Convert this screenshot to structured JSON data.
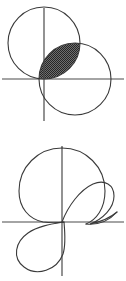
{
  "page": {
    "width": 126,
    "height": 281,
    "background_color": "#ffffff"
  },
  "style": {
    "curve_color": "#3a3a3a",
    "axis_color": "#4a4a4a",
    "shade_fill_color": "#4a4a4a",
    "shade_dot_color": "#2b2b2b",
    "curve_width": 1.1,
    "axis_width": 1.2
  },
  "figures": [
    {
      "id": "figure-top",
      "name": "two-overlapping-circles-with-shaded-lens",
      "caption": "Two equal circles intersecting; the lens-shaped overlap region is shaded",
      "axes": {
        "origin_x": 44,
        "origin_y": 79,
        "x_axis_start": 2,
        "x_axis_end": 124,
        "y_axis_start": 8,
        "y_axis_end": 121
      },
      "shapes": [
        {
          "name": "upper-left-circle",
          "type": "circle",
          "cx": 44,
          "cy": 43,
          "r": 36
        },
        {
          "name": "lower-right-circle",
          "type": "circle",
          "cx": 75,
          "cy": 79,
          "r": 36
        }
      ],
      "shaded_region": {
        "name": "lens-intersection",
        "type": "lens",
        "fill": "crosshatch-dots",
        "vertex_a_x": 44,
        "vertex_a_y": 79,
        "vertex_b_x": 75,
        "vertex_b_y": 43
      }
    },
    {
      "id": "figure-bottom",
      "name": "limacon-with-inner-loop",
      "caption": "A limacon style curve: large outer circular lobe, inner loop at the right, and a lower-left lobe crossing the origin",
      "axes": {
        "origin_x": 62,
        "origin_y": 222,
        "x_axis_start": 2,
        "x_axis_end": 124,
        "y_axis_start": 146,
        "y_axis_end": 276
      },
      "shapes": [
        {
          "name": "outer-large-circle",
          "type": "circle",
          "cx": 62,
          "cy": 191,
          "r": 43
        },
        {
          "name": "inner-right-loop",
          "type": "loop"
        },
        {
          "name": "lower-left-lobe",
          "type": "loop"
        }
      ]
    }
  ]
}
